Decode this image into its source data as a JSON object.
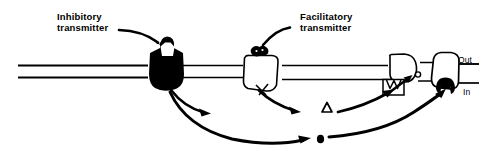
{
  "figure": {
    "type": "neuroscience-schematic-diagram",
    "background_color": "#ffffff",
    "ink_color": "#000000",
    "width": 483,
    "height": 151
  },
  "labels": {
    "inhibitory_line1": "Inhibitory",
    "inhibitory_line2": "transmitter",
    "facilitatory_line1": "Facilitatory",
    "facilitatory_line2": "transmitter",
    "out": "Out",
    "in": "In"
  },
  "symbols": {
    "triangle": "Δ",
    "dot": "●"
  },
  "elements": {
    "axon_fiber": "horizontal-double-line-nerve-fiber",
    "inhibitory_synapse": "filled-black-bouton-with-notch",
    "facilitatory_synapse": "outline-bouton-with-black-vesicle-cap",
    "third-terminal": "outline-terminal-with-arrow",
    "output-terminal": "outline-terminal-with-black-dome",
    "pointer_inhibitory": "curved-pointer-line",
    "pointer_facilitatory": "curved-pointer-line",
    "arrow_to_triangle": "curved-arrow",
    "arrow_from_triangle": "curved-arrow",
    "arrow_long_bottom": "long-curved-arrow",
    "arrow_to_dot": "curved-arrow",
    "arrow_from_dot": "curved-arrow"
  }
}
